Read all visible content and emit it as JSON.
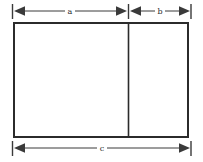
{
  "figure": {
    "type": "dimensioned-rectangle-diagram",
    "background_color": "#ffffff",
    "line_color": "#3a3a3a",
    "outline_color": "#2b2b2b",
    "label_color": "#2b2b2b"
  },
  "shape": {
    "name": "rectangle",
    "left": 13,
    "top": 22,
    "right": 189,
    "bottom": 138,
    "width": 176,
    "height": 116,
    "border_width": 2,
    "divider": {
      "name": "vertical-divider",
      "x": 128,
      "width": 1.6
    },
    "panels": [
      {
        "name": "left-panel",
        "label_ref": "a"
      },
      {
        "name": "right-panel",
        "label_ref": "b"
      }
    ]
  },
  "dimensions": [
    {
      "id": "a",
      "label": "a",
      "position": "top-left",
      "line_y": 11,
      "start_x": 12,
      "end_x": 128,
      "label_x": 70,
      "arrows": "both"
    },
    {
      "id": "b",
      "label": "b",
      "position": "top-right",
      "line_y": 11,
      "start_x": 129,
      "end_x": 191,
      "label_x": 160,
      "arrows": "both"
    },
    {
      "id": "c",
      "label": "c",
      "position": "bottom",
      "line_y": 148,
      "start_x": 12,
      "end_x": 191,
      "label_x": 102,
      "arrows": "both"
    }
  ],
  "extension_ticks": [
    {
      "name": "tick-left",
      "x": 12
    },
    {
      "name": "tick-middle",
      "x": 128
    },
    {
      "name": "tick-right",
      "x": 191
    }
  ]
}
